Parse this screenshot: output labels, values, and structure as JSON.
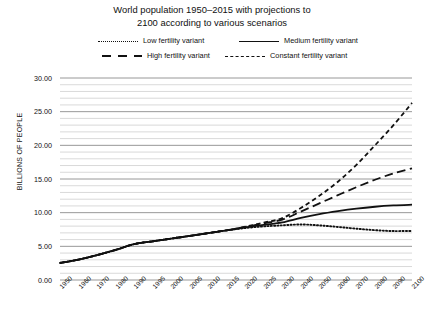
{
  "chart_data": {
    "type": "line",
    "title": "World population 1950–2015 with projections to 2100 according to various scenarios",
    "title_line1": "World population 1950–2015 with projections to",
    "title_line2": "2100 according to various scenarios",
    "xlabel": "",
    "ylabel": "BILLIONS OF PEOPLE",
    "ylim": [
      0,
      30
    ],
    "ytick_labels": [
      "0.00",
      "5.00",
      "10.00",
      "15.00",
      "20.00",
      "25.00",
      "30.00"
    ],
    "ytick_values": [
      0,
      5,
      10,
      15,
      20,
      25,
      30
    ],
    "minor_gridline_step": 1,
    "grid": true,
    "legend_position": "top",
    "categories": [
      "1950",
      "1960",
      "1970",
      "1980",
      "1990",
      "1995",
      "2000",
      "2005",
      "2010",
      "2015",
      "2020",
      "2025",
      "2030",
      "2040",
      "2050",
      "2060",
      "2070",
      "2080",
      "2090",
      "2100"
    ],
    "series": [
      {
        "name": "Low fertility variant",
        "style": "dotted",
        "color": "#111111",
        "values": [
          2.53,
          3.03,
          3.7,
          4.46,
          5.33,
          5.74,
          6.15,
          6.54,
          6.96,
          7.38,
          7.72,
          7.96,
          8.12,
          8.25,
          8.11,
          7.88,
          7.62,
          7.4,
          7.27,
          7.29
        ]
      },
      {
        "name": "Medium fertility variant",
        "style": "solid",
        "color": "#111111",
        "values": [
          2.53,
          3.03,
          3.7,
          4.46,
          5.33,
          5.74,
          6.15,
          6.54,
          6.96,
          7.38,
          7.8,
          8.19,
          8.55,
          9.21,
          9.77,
          10.22,
          10.6,
          10.88,
          11.07,
          11.18
        ]
      },
      {
        "name": "High fertility variant",
        "style": "longdash",
        "color": "#111111",
        "values": [
          2.53,
          3.03,
          3.7,
          4.46,
          5.33,
          5.74,
          6.15,
          6.54,
          6.96,
          7.38,
          7.88,
          8.42,
          8.98,
          10.16,
          11.38,
          12.6,
          13.79,
          14.89,
          15.83,
          16.58
        ]
      },
      {
        "name": "Constant fertility variant",
        "style": "dashed",
        "color": "#111111",
        "values": [
          2.53,
          3.03,
          3.7,
          4.46,
          5.33,
          5.74,
          6.15,
          6.54,
          6.96,
          7.38,
          7.92,
          8.52,
          9.18,
          10.7,
          12.5,
          14.6,
          17.1,
          20.0,
          23.0,
          26.3
        ]
      }
    ]
  },
  "legend": {
    "items": [
      {
        "label": "Low fertility variant",
        "style": "dotted"
      },
      {
        "label": "Medium fertility variant",
        "style": "solid"
      },
      {
        "label": "High fertility variant",
        "style": "longdash"
      },
      {
        "label": "Constant fertility variant",
        "style": "dashed"
      }
    ]
  }
}
